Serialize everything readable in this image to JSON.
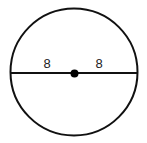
{
  "diagram": {
    "type": "circle-with-diameter",
    "circle": {
      "cx": 74,
      "cy": 72,
      "r": 63.5,
      "stroke": "#111111",
      "stroke_width": 2
    },
    "diameter": {
      "x1": 10,
      "y1": 73,
      "x2": 138,
      "y2": 73,
      "stroke": "#111111",
      "stroke_width": 2
    },
    "center_point": {
      "cx": 74.5,
      "cy": 73.5,
      "r": 4,
      "fill": "#000000"
    },
    "labels": {
      "left_radius": "8",
      "right_radius": "8"
    }
  }
}
